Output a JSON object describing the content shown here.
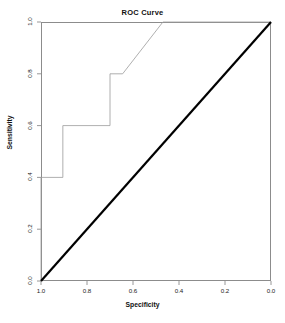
{
  "chart_data": {
    "type": "line",
    "title": "ROC Curve",
    "xlabel": "Specificity",
    "ylabel": "Sensitivity",
    "xlim": [
      1.0,
      0.0
    ],
    "ylim": [
      0.0,
      1.0
    ],
    "x_reversed": true,
    "grid": false,
    "legend": null,
    "xticks": [
      "1.0",
      "0.8",
      "0.6",
      "0.4",
      "0.2",
      "0.0"
    ],
    "xtick_values": [
      1.0,
      0.8,
      0.6,
      0.4,
      0.2,
      0.0
    ],
    "yticks": [
      "0.0",
      "0.2",
      "0.4",
      "0.6",
      "0.8",
      "1.0"
    ],
    "ytick_values": [
      0.0,
      0.2,
      0.4,
      0.6,
      0.8,
      1.0
    ],
    "series": [
      {
        "name": "ROC curve",
        "color": "#9a9a9a",
        "line_width": 0.8,
        "style": "step",
        "x": [
          1.0,
          1.0,
          0.905,
          0.905,
          0.7,
          0.7,
          0.645,
          0.47,
          0.0
        ],
        "y": [
          0.0,
          0.4,
          0.4,
          0.6,
          0.6,
          0.8,
          0.8,
          1.0,
          1.0
        ],
        "points": [
          {
            "specificity": 1.0,
            "sensitivity": 0.0
          },
          {
            "specificity": 1.0,
            "sensitivity": 0.4
          },
          {
            "specificity": 0.905,
            "sensitivity": 0.4
          },
          {
            "specificity": 0.905,
            "sensitivity": 0.6
          },
          {
            "specificity": 0.7,
            "sensitivity": 0.6
          },
          {
            "specificity": 0.7,
            "sensitivity": 0.8
          },
          {
            "specificity": 0.645,
            "sensitivity": 0.8
          },
          {
            "specificity": 0.47,
            "sensitivity": 1.0
          },
          {
            "specificity": 0.0,
            "sensitivity": 1.0
          }
        ]
      },
      {
        "name": "Chance diagonal",
        "color": "#000000",
        "line_width": 2.2,
        "style": "solid",
        "x": [
          1.0,
          0.0
        ],
        "y": [
          0.0,
          1.0
        ]
      }
    ]
  },
  "plot": {
    "title": "ROC Curve",
    "axis_x_title": "Specificity",
    "axis_y_title": "Sensitivity",
    "background_color": "#ffffff",
    "frame_color": "#8c8c8c",
    "curve_color": "#9a9a9a",
    "diagonal_color": "#000000"
  }
}
